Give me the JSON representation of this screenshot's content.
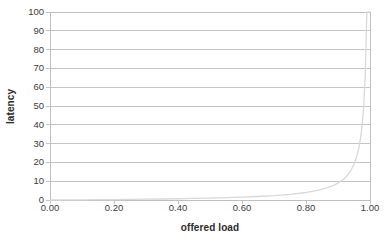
{
  "chart_data": {
    "type": "line",
    "title": "",
    "xlabel": "offered load",
    "ylabel": "latency",
    "xlim": [
      0.0,
      1.0
    ],
    "ylim": [
      0,
      100
    ],
    "grid": true,
    "legend": false,
    "x_ticks": [
      "0.00",
      "0.20",
      "0.40",
      "0.60",
      "0.80",
      "1.00"
    ],
    "x_tick_values": [
      0.0,
      0.2,
      0.4,
      0.6,
      0.8,
      1.0
    ],
    "y_ticks": [
      "0",
      "10",
      "20",
      "30",
      "40",
      "50",
      "60",
      "70",
      "80",
      "90",
      "100"
    ],
    "y_tick_values": [
      0,
      10,
      20,
      30,
      40,
      50,
      60,
      70,
      80,
      90,
      100
    ],
    "series": [
      {
        "name": "latency",
        "color": "#d9d9d9",
        "x": [
          0.0,
          0.05,
          0.1,
          0.15,
          0.2,
          0.25,
          0.3,
          0.35,
          0.4,
          0.45,
          0.5,
          0.55,
          0.6,
          0.65,
          0.7,
          0.75,
          0.8,
          0.82,
          0.84,
          0.86,
          0.88,
          0.9,
          0.91,
          0.92,
          0.93,
          0.94,
          0.95,
          0.96,
          0.965,
          0.97,
          0.975,
          0.98,
          0.985,
          0.99,
          0.992,
          0.994,
          0.995,
          0.996,
          0.997,
          0.998,
          0.999
        ],
        "y": [
          0.0,
          0.05,
          0.11,
          0.18,
          0.25,
          0.33,
          0.43,
          0.54,
          0.67,
          0.82,
          1.0,
          1.22,
          1.5,
          1.86,
          2.33,
          3.0,
          4.0,
          4.56,
          5.25,
          6.14,
          7.33,
          9.0,
          10.11,
          11.5,
          13.29,
          15.67,
          19.0,
          24.0,
          27.57,
          32.33,
          39.0,
          49.0,
          65.67,
          99.0,
          100.0,
          100.0,
          100.0,
          100.0,
          100.0,
          100.0,
          100.0
        ]
      }
    ]
  },
  "axes": {
    "plot_left_px": 50,
    "plot_right_px": 370,
    "plot_top_px": 12,
    "plot_bottom_px": 200,
    "grid_color": "#c4c4c4",
    "border_color": "#bfbfbf",
    "tick_color": "#c4c4c4",
    "background": "#ffffff",
    "label_color": "#3a3a3a",
    "title_color": "#2b2b2b"
  }
}
